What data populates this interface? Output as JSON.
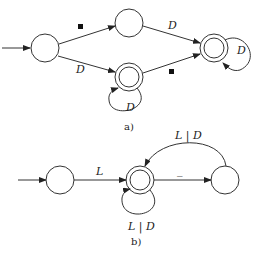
{
  "diagram_a": {
    "caption": "a)",
    "states": [
      {
        "id": "a0",
        "start": true,
        "accepting": false
      },
      {
        "id": "a1",
        "start": false,
        "accepting": false
      },
      {
        "id": "a2",
        "start": false,
        "accepting": true
      },
      {
        "id": "a3",
        "start": false,
        "accepting": true
      }
    ],
    "transitions": [
      {
        "from": "a0",
        "to": "a1",
        "label": "■"
      },
      {
        "from": "a0",
        "to": "a2",
        "label": "D"
      },
      {
        "from": "a1",
        "to": "a3",
        "label": "D"
      },
      {
        "from": "a2",
        "to": "a3",
        "label": "■"
      },
      {
        "from": "a2",
        "to": "a2",
        "label": "D"
      },
      {
        "from": "a3",
        "to": "a3",
        "label": "D"
      }
    ],
    "labels": {
      "a0_a1": "■",
      "a0_a2": "D",
      "a1_a3": "D",
      "a2_a3": "■",
      "a2_loop": "D",
      "a3_loop": "D"
    }
  },
  "diagram_b": {
    "caption": "b)",
    "states": [
      {
        "id": "b0",
        "start": true,
        "accepting": false
      },
      {
        "id": "b1",
        "start": false,
        "accepting": true
      },
      {
        "id": "b2",
        "start": false,
        "accepting": false
      }
    ],
    "transitions": [
      {
        "from": "b0",
        "to": "b1",
        "label": "L"
      },
      {
        "from": "b1",
        "to": "b1",
        "label": "L | D"
      },
      {
        "from": "b1",
        "to": "b2",
        "label": "_"
      },
      {
        "from": "b2",
        "to": "b1",
        "label": "L | D"
      }
    ],
    "labels": {
      "b0_b1": "L",
      "b1_loop": "L | D",
      "b1_b2": "_",
      "b2_b1": "L | D"
    }
  }
}
